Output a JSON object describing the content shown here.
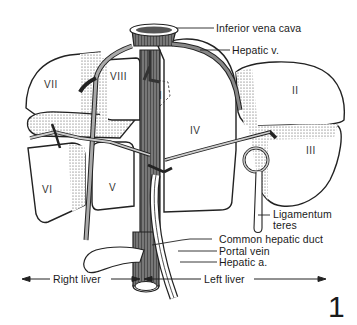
{
  "figure": {
    "number": "1"
  },
  "segments": [
    {
      "id": "seg-1",
      "label": "I"
    },
    {
      "id": "seg-2",
      "label": "II"
    },
    {
      "id": "seg-3",
      "label": "III"
    },
    {
      "id": "seg-4",
      "label": "IV"
    },
    {
      "id": "seg-5",
      "label": "V"
    },
    {
      "id": "seg-6",
      "label": "VI"
    },
    {
      "id": "seg-7",
      "label": "VII"
    },
    {
      "id": "seg-8",
      "label": "VIII"
    }
  ],
  "callouts": {
    "ivc": "Inferior vena cava",
    "hepatic_vein": "Hepatic v.",
    "ligamentum_1": "Ligamentum",
    "ligamentum_2": "teres",
    "common_hepatic_duct": "Common hepatic duct",
    "portal_vein": "Portal vein",
    "hepatic_artery": "Hepatic a."
  },
  "divisions": {
    "right": "Right liver",
    "left": "Left liver"
  },
  "colors": {
    "ink": "#1a1a1a",
    "paper": "#ffffff",
    "shade": "#9a9a9a"
  }
}
